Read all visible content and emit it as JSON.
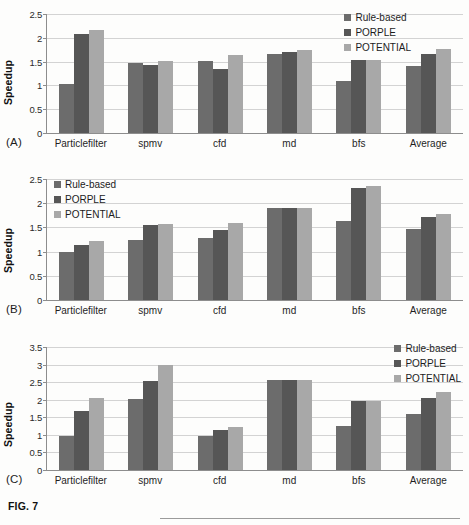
{
  "figure": {
    "caption": "FIG. 7",
    "panel_tags": [
      "(A)",
      "(B)",
      "(C)"
    ]
  },
  "legend": {
    "series": [
      "Rule-based",
      "PORPLE",
      "POTENTIAL"
    ],
    "colors": [
      "#6c6c6c",
      "#565656",
      "#a8a8a8"
    ]
  },
  "chart_data": [
    {
      "type": "bar",
      "panel": "(A)",
      "title": "",
      "xlabel": "",
      "ylabel": "Speedup",
      "categories": [
        "Particlefilter",
        "spmv",
        "cfd",
        "md",
        "bfs",
        "Average"
      ],
      "yticks": [
        "0",
        "0.5",
        "1",
        "1.5",
        "2",
        "2.5"
      ],
      "ylim": [
        0,
        2.5
      ],
      "grid": true,
      "legend_position": "top-right",
      "series": [
        {
          "name": "Rule-based",
          "color": "#6c6c6c",
          "values": [
            1.02,
            1.48,
            1.52,
            1.65,
            1.09,
            1.4
          ]
        },
        {
          "name": "PORPLE",
          "color": "#565656",
          "values": [
            2.08,
            1.43,
            1.35,
            1.7,
            1.53,
            1.65
          ]
        },
        {
          "name": "POTENTIAL",
          "color": "#a8a8a8",
          "values": [
            2.16,
            1.51,
            1.63,
            1.74,
            1.53,
            1.76
          ]
        }
      ]
    },
    {
      "type": "bar",
      "panel": "(B)",
      "title": "",
      "xlabel": "",
      "ylabel": "Speedup",
      "categories": [
        "Particlefilter",
        "spmv",
        "cfd",
        "md",
        "bfs",
        "Average"
      ],
      "yticks": [
        "0",
        "0.5",
        "1",
        "1.5",
        "2",
        "2.5"
      ],
      "ylim": [
        0,
        2.5
      ],
      "grid": true,
      "legend_position": "top-left",
      "series": [
        {
          "name": "Rule-based",
          "color": "#6c6c6c",
          "values": [
            1.0,
            1.23,
            1.29,
            1.91,
            1.64,
            1.47
          ]
        },
        {
          "name": "PORPLE",
          "color": "#565656",
          "values": [
            1.14,
            1.56,
            1.45,
            1.91,
            2.31,
            1.72
          ]
        },
        {
          "name": "POTENTIAL",
          "color": "#a8a8a8",
          "values": [
            1.22,
            1.58,
            1.6,
            1.91,
            2.35,
            1.77
          ]
        }
      ]
    },
    {
      "type": "bar",
      "panel": "(C)",
      "title": "",
      "xlabel": "",
      "ylabel": "Speedup",
      "categories": [
        "Particlefilter",
        "spmv",
        "cfd",
        "md",
        "bfs",
        "Average"
      ],
      "yticks": [
        "0",
        "0.5",
        "1",
        "1.5",
        "2",
        "2.5",
        "3",
        "3.5"
      ],
      "ylim": [
        0,
        3.5
      ],
      "grid": true,
      "legend_position": "top-right",
      "series": [
        {
          "name": "Rule-based",
          "color": "#6c6c6c",
          "values": [
            0.97,
            2.01,
            0.97,
            2.55,
            1.24,
            1.6
          ]
        },
        {
          "name": "PORPLE",
          "color": "#565656",
          "values": [
            1.67,
            2.54,
            1.14,
            2.57,
            1.96,
            2.04
          ]
        },
        {
          "name": "POTENTIAL",
          "color": "#a8a8a8",
          "values": [
            2.06,
            2.98,
            1.23,
            2.57,
            1.96,
            2.22
          ]
        }
      ]
    }
  ]
}
